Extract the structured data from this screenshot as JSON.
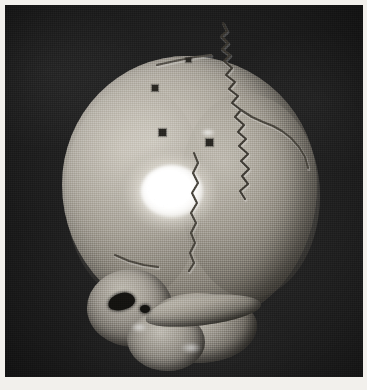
{
  "figure": {
    "kind": "photograph",
    "view": "posterior-lateral (occipital) aspect",
    "rendering": "halftone grayscale scan",
    "background_color": "#242424",
    "page_margin_color": "#f2f0ec",
    "bone_color": "#a9a49a",
    "highlight_color": "#ffffff",
    "shadow_color": "#3a362f",
    "caption": "",
    "title": ""
  },
  "anatomy": {
    "cranium_label": "cranial vault",
    "left_lobe_label": "left parietal / occipital region",
    "right_lobe_label": "right parietal region",
    "specular_label": "specular highlight on parietal bone",
    "base_label": "skull base",
    "mastoid_left_label": "left mastoid region",
    "mastoid_right_label": "right mastoid region",
    "condyle_label": "occipital condyle region",
    "zygomatic_label": "zygomatic arch",
    "auditory_meatus_label": "external auditory meatus",
    "small_foramen_label": "foramen"
  },
  "sutures": [
    {
      "name": "lambdoid-suture-main",
      "description": "jagged suture running from vertex down the right posterior vault",
      "stroke": "#3f3b34",
      "path": "M 218 18 L 222 26 L 216 31 L 223 38 L 217 44 L 225 50 L 219 56 L 227 63 L 221 70 L 230 77 L 224 84 L 233 91 L 227 98 L 236 105 L 230 112 L 239 120 L 233 127 L 241 134 L 234 141 L 243 149 L 236 156 L 244 164 L 237 171 L 243 179 L 235 186 L 240 194"
    },
    {
      "name": "lambdoid-suture-right-limb",
      "description": "suture branching right toward the asterion",
      "stroke": "#4a463e",
      "path": "M 236 105 L 247 112 L 258 117 L 268 121 L 277 126 L 286 133 L 294 142 L 300 152 L 303 163"
    },
    {
      "name": "occipitomastoid-suture",
      "description": "vertical suture descending below the highlight toward the base",
      "stroke": "#4a463e",
      "path": "M 189 148 L 193 158 L 188 168 L 193 178 L 187 188 L 192 198 L 186 208 L 191 218 L 186 228 L 190 238 L 185 248 L 189 258 L 184 266"
    },
    {
      "name": "parietomastoid-suture",
      "description": "short oblique suture at the left of the base",
      "stroke": "#4d4941",
      "path": "M 110 250 L 124 256 L 139 260 L 153 262"
    },
    {
      "name": "sutural-bone-crack",
      "description": "fine crack along upper left of the lambdoid",
      "stroke": "#55514a",
      "path": "M 152 60 L 170 56 L 190 52 L 206 50"
    }
  ],
  "foramina": [
    {
      "name": "foramen-1",
      "x": 147,
      "y": 80,
      "w": 6,
      "h": 6
    },
    {
      "name": "foramen-2",
      "x": 154,
      "y": 124,
      "w": 7,
      "h": 7
    },
    {
      "name": "foramen-3",
      "x": 201,
      "y": 134,
      "w": 7,
      "h": 7
    },
    {
      "name": "foramen-4",
      "x": 181,
      "y": 53,
      "w": 5,
      "h": 4
    }
  ],
  "gleams": [
    {
      "name": "gleam-suture",
      "x": 196,
      "y": 124,
      "w": 14,
      "h": 7
    },
    {
      "name": "gleam-base",
      "x": 176,
      "y": 338,
      "w": 20,
      "h": 10
    },
    {
      "name": "gleam-mastoid",
      "x": 126,
      "y": 318,
      "w": 16,
      "h": 9
    }
  ]
}
